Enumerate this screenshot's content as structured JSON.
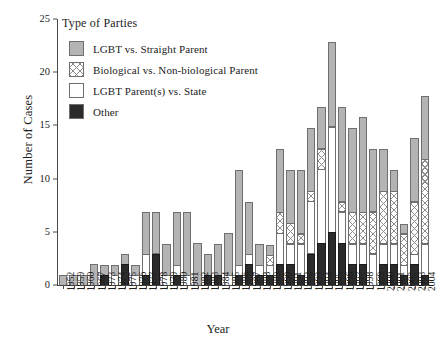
{
  "chart_data": {
    "type": "bar",
    "subtype": "stacked",
    "title": "",
    "xlabel": "Year",
    "ylabel": "Number of Cases",
    "ylim": [
      0,
      25
    ],
    "yticks": [
      0,
      5,
      10,
      15,
      20,
      25
    ],
    "grid": false,
    "legend": {
      "title": "Type of Parties",
      "position": "upper-left-inside",
      "entries": [
        {
          "name": "LGBT vs. Straight Parent",
          "swatch": "gray",
          "color": "#b4b4b4"
        },
        {
          "name": "Biological vs. Non-biological Parent",
          "swatch": "crosshatch",
          "color": "#ffffff"
        },
        {
          "name": "LGBT Parent(s) vs. State",
          "swatch": "white",
          "color": "#ffffff"
        },
        {
          "name": "Other",
          "swatch": "black",
          "color": "#2b2b2b"
        }
      ]
    },
    "categories": [
      "1952",
      "1959",
      "1960",
      "1967",
      "1973",
      "1974",
      "1975",
      "1976",
      "1977",
      "1978",
      "1979",
      "1980",
      "1981",
      "1982",
      "1983",
      "1984",
      "1985",
      "1986",
      "1987",
      "1988",
      "1989",
      "1990",
      "1991",
      "1992",
      "1993",
      "1994",
      "1995",
      "1996",
      "1997",
      "1998",
      "1999",
      "2000",
      "2001",
      "2002",
      "2003",
      "2004"
    ],
    "series": [
      {
        "name": "Other",
        "values": [
          0,
          0,
          0,
          0,
          1,
          0,
          2,
          0,
          1,
          3,
          0,
          1,
          0,
          0,
          1,
          1,
          0,
          1,
          2,
          1,
          1,
          2,
          2,
          1,
          3,
          4,
          5,
          4,
          2,
          2,
          0,
          2,
          2,
          1,
          2,
          1
        ]
      },
      {
        "name": "LGBT Parent(s) vs. State",
        "values": [
          0,
          0,
          0,
          0,
          0,
          1,
          0,
          1,
          2,
          0,
          1,
          1,
          1,
          0,
          0,
          0,
          1,
          1,
          1,
          1,
          1,
          3,
          2,
          3,
          5,
          7,
          10,
          3,
          2,
          2,
          3,
          2,
          2,
          1,
          1,
          3
        ]
      },
      {
        "name": "Biological vs. Non-biological Parent",
        "values": [
          0,
          0,
          0,
          0,
          0,
          0,
          0,
          0,
          0,
          0,
          0,
          0,
          0,
          0,
          0,
          0,
          0,
          0,
          0,
          0,
          1,
          2,
          2,
          1,
          1,
          2,
          0,
          1,
          3,
          3,
          4,
          5,
          5,
          3,
          5,
          8
        ]
      },
      {
        "name": "LGBT vs. Straight Parent",
        "values": [
          1,
          1,
          1,
          2,
          1,
          1,
          1,
          1,
          4,
          4,
          3,
          5,
          6,
          4,
          2,
          3,
          4,
          9,
          5,
          2,
          1,
          6,
          5,
          6,
          6,
          4,
          8,
          9,
          8,
          9,
          6,
          4,
          2,
          1,
          6,
          6
        ]
      }
    ],
    "totals": [
      1,
      1,
      1,
      2,
      2,
      2,
      3,
      2,
      7,
      7,
      4,
      7,
      7,
      4,
      3,
      4,
      5,
      11,
      8,
      4,
      4,
      13,
      11,
      11,
      15,
      17,
      23,
      17,
      15,
      16,
      13,
      13,
      11,
      6,
      14,
      18
    ]
  }
}
